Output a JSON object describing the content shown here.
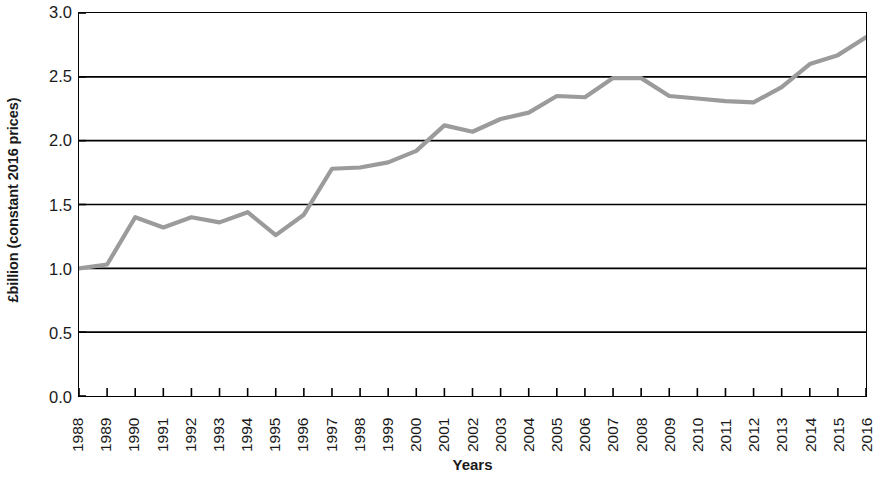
{
  "chart_data": {
    "type": "line",
    "title": "",
    "xlabel": "Years",
    "ylabel": "£billion (constant 2016 prices)",
    "categories": [
      "1988",
      "1989",
      "1990",
      "1991",
      "1992",
      "1993",
      "1994",
      "1995",
      "1996",
      "1997",
      "1998",
      "1999",
      "2000",
      "2001",
      "2002",
      "2003",
      "2004",
      "2005",
      "2006",
      "2007",
      "2008",
      "2009",
      "2010",
      "2011",
      "2012",
      "2013",
      "2014",
      "2015",
      "2016"
    ],
    "values": [
      1.0,
      1.03,
      1.4,
      1.32,
      1.4,
      1.36,
      1.44,
      1.26,
      1.42,
      1.78,
      1.79,
      1.83,
      1.92,
      2.12,
      2.07,
      2.17,
      2.22,
      2.35,
      2.34,
      2.49,
      2.49,
      2.35,
      2.33,
      2.31,
      2.3,
      2.42,
      2.6,
      2.67,
      2.81
    ],
    "series": [
      {
        "name": "",
        "color": "#9b9b9b",
        "values": [
          1.0,
          1.03,
          1.4,
          1.32,
          1.4,
          1.36,
          1.44,
          1.26,
          1.42,
          1.78,
          1.79,
          1.83,
          1.92,
          2.12,
          2.07,
          2.17,
          2.22,
          2.35,
          2.34,
          2.49,
          2.49,
          2.35,
          2.33,
          2.31,
          2.3,
          2.42,
          2.6,
          2.67,
          2.81
        ]
      }
    ],
    "ylim": [
      0.0,
      3.0
    ],
    "yticks": [
      0.0,
      0.5,
      1.0,
      1.5,
      2.0,
      2.5,
      3.0
    ],
    "ytick_labels": [
      "0.0",
      "0.5",
      "1.0",
      "1.5",
      "2.0",
      "2.5",
      "3.0"
    ],
    "grid": "horizontal",
    "gridline_color": "#000000",
    "legend": "none",
    "axis_color": "#000000",
    "background": "#ffffff"
  }
}
